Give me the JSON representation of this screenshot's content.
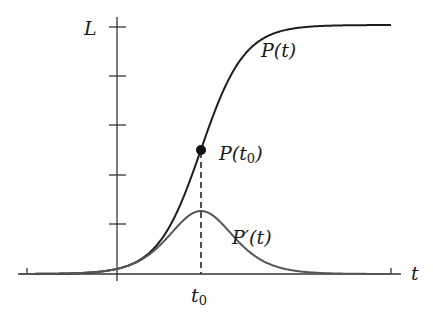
{
  "chart_data": {
    "type": "line",
    "title": "",
    "xlabel": "t",
    "ylabel": "L",
    "grid": false,
    "legend": "none (inline curve labels)",
    "y_ticks_count": 5,
    "y_tick_top_label": "L",
    "x_tick_labels": [
      "t0"
    ],
    "annotations": [
      {
        "text": "P(t)",
        "target": "logistic curve"
      },
      {
        "text": "P(t0)",
        "target": "inflection point marker at t0, height L/2"
      },
      {
        "text": "P′(t)",
        "target": "derivative bell curve, peak at t0"
      },
      {
        "text": "t0",
        "target": "x-axis position of inflection point, dashed vertical line"
      }
    ],
    "series": [
      {
        "name": "P(t)",
        "kind": "logistic",
        "description": "S-shaped curve rising from 0 to carrying capacity L, midpoint L/2 at t0",
        "x_rel_t0": [
          -80,
          -40,
          -20,
          -10,
          0,
          10,
          20,
          40,
          80
        ],
        "y_frac_of_L": [
          0.02,
          0.14,
          0.28,
          0.39,
          0.5,
          0.61,
          0.72,
          0.86,
          0.98
        ]
      },
      {
        "name": "P′(t)",
        "kind": "bell",
        "description": "Derivative of P(t); bell-shaped with maximum at t0 (about 0.25 of L in plot height)",
        "x_rel_t0": [
          -80,
          -40,
          -20,
          -10,
          0,
          10,
          20,
          40,
          80
        ],
        "y_frac_of_L": [
          0.01,
          0.1,
          0.2,
          0.24,
          0.25,
          0.24,
          0.2,
          0.1,
          0.01
        ]
      }
    ],
    "point": {
      "label": "P(t0)",
      "x": "t0",
      "y": "L/2"
    }
  },
  "labels": {
    "y_axis": "L",
    "x_axis": "t",
    "curve_p": "P(t)",
    "point": "P(t",
    "point_sub": "0",
    "point_close": ")",
    "curve_dp": "P′(t)",
    "t0": "t",
    "t0_sub": "0"
  },
  "colors": {
    "p_curve": "#1e1e1e",
    "dp_curve": "#555555",
    "axis": "#333333"
  }
}
